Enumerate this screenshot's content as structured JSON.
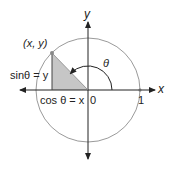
{
  "diagram": {
    "axes": {
      "x_label": "x",
      "y_label": "y"
    },
    "labels": {
      "point": "(x, y)",
      "sin": "sinθ = y",
      "cos": "cos θ = x",
      "theta": "θ",
      "origin": "0",
      "one": "1"
    },
    "colors": {
      "circle": "#9a9a9a",
      "triangle_fill": "#c6c6c6",
      "axis": "#222222",
      "text": "#222222"
    },
    "geometry": {
      "center": [
        88,
        90
      ],
      "radius": 52,
      "point": [
        52,
        53
      ],
      "arc_radius": 24
    }
  }
}
